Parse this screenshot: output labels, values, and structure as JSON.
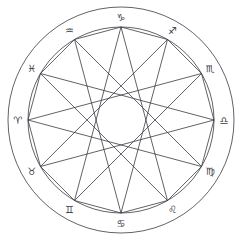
{
  "diagram": {
    "type": "astrological-chart",
    "background_color": "#ffffff",
    "stroke_color": "#3a3a42",
    "glyph_color": "#3a3a42",
    "line_width": 0.8,
    "center": {
      "x": 121,
      "y": 120
    },
    "circles": [
      {
        "name": "outer-circle",
        "radius": 113
      },
      {
        "name": "inner-circle",
        "radius": 93
      }
    ],
    "signs": [
      {
        "name": "capricorn",
        "glyph": "♑",
        "label": "Capricorn",
        "angle_deg": 270,
        "index": 0,
        "label_radius": 103,
        "vertex_radius": 93
      },
      {
        "name": "sagittarius",
        "glyph": "♐",
        "label": "Sagittarius",
        "angle_deg": 300,
        "index": 1,
        "label_radius": 103,
        "vertex_radius": 93
      },
      {
        "name": "scorpio",
        "glyph": "♏",
        "label": "Scorpio",
        "angle_deg": 330,
        "index": 2,
        "label_radius": 103,
        "vertex_radius": 93
      },
      {
        "name": "libra",
        "glyph": "♎",
        "label": "Libra",
        "angle_deg": 0,
        "index": 3,
        "label_radius": 103,
        "vertex_radius": 93
      },
      {
        "name": "virgo",
        "glyph": "♍",
        "label": "Virgo",
        "angle_deg": 30,
        "index": 4,
        "label_radius": 103,
        "vertex_radius": 93
      },
      {
        "name": "leo",
        "glyph": "♌",
        "label": "Leo",
        "angle_deg": 60,
        "index": 5,
        "label_radius": 103,
        "vertex_radius": 93
      },
      {
        "name": "cancer",
        "glyph": "♋",
        "label": "Cancer",
        "angle_deg": 90,
        "index": 6,
        "label_radius": 103,
        "vertex_radius": 93
      },
      {
        "name": "gemini",
        "glyph": "♊",
        "label": "Gemini",
        "angle_deg": 120,
        "index": 7,
        "label_radius": 103,
        "vertex_radius": 93
      },
      {
        "name": "taurus",
        "glyph": "♉",
        "label": "Taurus",
        "angle_deg": 150,
        "index": 8,
        "label_radius": 103,
        "vertex_radius": 93
      },
      {
        "name": "aries",
        "glyph": "♈",
        "label": "Aries",
        "angle_deg": 180,
        "index": 9,
        "label_radius": 103,
        "vertex_radius": 93
      },
      {
        "name": "pisces",
        "glyph": "♓",
        "label": "Pisces",
        "angle_deg": 210,
        "index": 10,
        "label_radius": 103,
        "vertex_radius": 93
      },
      {
        "name": "aquarius",
        "glyph": "♒",
        "label": "Aquarius",
        "angle_deg": 240,
        "index": 11,
        "label_radius": 103,
        "vertex_radius": 93
      }
    ],
    "star_polygons": [
      {
        "name": "dodecagon-edges",
        "step": 1,
        "description": "Twelve-sided polygon joining adjacent sign vertices"
      },
      {
        "name": "star-12-5",
        "step": 5,
        "description": "Twelve-point star chords skipping five positions"
      }
    ]
  }
}
